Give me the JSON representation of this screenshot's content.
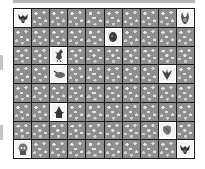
{
  "game": {
    "type": "memory-match",
    "columns": 10,
    "rows": 8,
    "colors": {
      "tile_hidden": "#8e8e8e",
      "tile_revealed": "#f4f4f4",
      "grid_line": "#1a1a1a",
      "top_bar": "#b8b8b8"
    },
    "revealed_tiles": [
      {
        "row": 0,
        "col": 0,
        "creature": "bat-creature-icon"
      },
      {
        "row": 0,
        "col": 9,
        "creature": "bunny-creature-icon"
      },
      {
        "row": 1,
        "col": 5,
        "creature": "ghost-head-icon"
      },
      {
        "row": 2,
        "col": 2,
        "creature": "bird-creature-icon"
      },
      {
        "row": 3,
        "col": 2,
        "creature": "slug-creature-icon"
      },
      {
        "row": 3,
        "col": 8,
        "creature": "spiky-bug-icon"
      },
      {
        "row": 5,
        "col": 2,
        "creature": "witch-creature-icon"
      },
      {
        "row": 6,
        "col": 8,
        "creature": "moth-creature-icon"
      },
      {
        "row": 7,
        "col": 0,
        "creature": "skull-creature-icon"
      },
      {
        "row": 7,
        "col": 9,
        "creature": "bat-creature-icon"
      }
    ]
  }
}
